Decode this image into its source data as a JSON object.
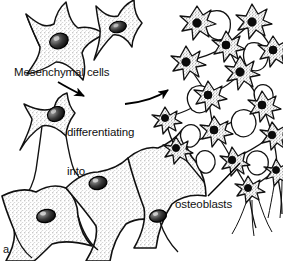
{
  "figure": {
    "panel_letter": "a",
    "caption_type": "line-drawing",
    "background_color": "#ffffff",
    "ink_color": "#000000",
    "stipple_color": "#7a7a7a"
  },
  "labels": {
    "mesenchymal": "Mesenchymal cells",
    "differentiating_line1": "differentiating",
    "differentiating_line2": "into",
    "osteoblasts": "osteoblasts"
  },
  "annotations": {
    "arrow_to_differentiating": "curved-arrow-down-right",
    "arrow_to_osteoblasts": "curved-arrow-up-right",
    "leader_line_osteoblasts": "leader-line-up-right"
  },
  "cells": {
    "mesenchymal_group": [
      {
        "cx": 58,
        "cy": 42,
        "r": 26,
        "nucleus_rx": 9,
        "nucleus_ry": 7,
        "nucleus_rot": -20,
        "arms": 5
      },
      {
        "cx": 117,
        "cy": 25,
        "r": 23,
        "nucleus_rx": 8,
        "nucleus_ry": 5,
        "nucleus_rot": -12,
        "arms": 4
      }
    ],
    "differentiating_group": [
      {
        "cx": 58,
        "cy": 115,
        "r": 24,
        "nucleus_rx": 8,
        "nucleus_ry": 7,
        "nucleus_rot": -25,
        "arms": 4
      }
    ],
    "large_osteoblast_sheet": [
      {
        "cx": 45,
        "cy": 215,
        "r": 36,
        "nucleus_rx": 9,
        "nucleus_ry": 6,
        "nucleus_rot": -10,
        "arms": 4
      },
      {
        "cx": 95,
        "cy": 180,
        "r": 38,
        "nucleus_rx": 9,
        "nucleus_ry": 6,
        "nucleus_rot": -8,
        "arms": 4
      },
      {
        "cx": 152,
        "cy": 215,
        "r": 34,
        "nucleus_rx": 8,
        "nucleus_ry": 6,
        "nucleus_rot": -10,
        "arms": 4
      }
    ],
    "osteoblast_network": [
      {
        "cx": 197,
        "cy": 23,
        "r": 16,
        "nucleus_r": 4,
        "arms": 7
      },
      {
        "cx": 252,
        "cy": 22,
        "r": 16,
        "nucleus_r": 4,
        "arms": 7
      },
      {
        "cx": 226,
        "cy": 45,
        "r": 14,
        "nucleus_r": 4,
        "arms": 6
      },
      {
        "cx": 186,
        "cy": 62,
        "r": 15,
        "nucleus_r": 4,
        "arms": 7
      },
      {
        "cx": 240,
        "cy": 72,
        "r": 15,
        "nucleus_r": 4,
        "arms": 7
      },
      {
        "cx": 273,
        "cy": 50,
        "r": 13,
        "nucleus_r": 4,
        "arms": 6
      },
      {
        "cx": 208,
        "cy": 95,
        "r": 14,
        "nucleus_r": 4,
        "arms": 6
      },
      {
        "cx": 262,
        "cy": 105,
        "r": 14,
        "nucleus_r": 4,
        "arms": 6
      },
      {
        "cx": 165,
        "cy": 118,
        "r": 12,
        "nucleus_r": 3.5,
        "arms": 6
      },
      {
        "cx": 214,
        "cy": 130,
        "r": 14,
        "nucleus_r": 4,
        "arms": 7
      },
      {
        "cx": 272,
        "cy": 135,
        "r": 13,
        "nucleus_r": 4,
        "arms": 6
      },
      {
        "cx": 176,
        "cy": 148,
        "r": 12,
        "nucleus_r": 3.5,
        "arms": 6
      },
      {
        "cx": 232,
        "cy": 160,
        "r": 13,
        "nucleus_r": 4,
        "arms": 6
      },
      {
        "cx": 248,
        "cy": 188,
        "r": 12,
        "nucleus_r": 3.5,
        "arms": 6
      },
      {
        "cx": 276,
        "cy": 170,
        "r": 11,
        "nucleus_r": 3.5,
        "arms": 5
      }
    ]
  }
}
